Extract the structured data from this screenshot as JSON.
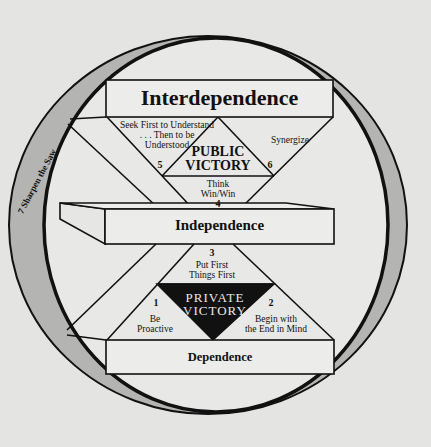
{
  "diagram": {
    "colors": {
      "background": "#e4e4e2",
      "ring": "#b4b4b2",
      "box_fill": "#ececea",
      "stroke": "#111111",
      "private_victory_fill": "#111111",
      "private_victory_text": "#e8e8e8"
    },
    "levels": {
      "interdependence": "Interdependence",
      "independence": "Independence",
      "dependence": "Dependence"
    },
    "victories": {
      "public": [
        "PUBLIC",
        "VICTORY"
      ],
      "private": [
        "PRIVATE",
        "VICTORY"
      ]
    },
    "habits": [
      {
        "number": "1",
        "lines": [
          "Be",
          "Proactive"
        ]
      },
      {
        "number": "2",
        "lines": [
          "Begin with",
          "the End in Mind"
        ]
      },
      {
        "number": "3",
        "lines": [
          "Put First",
          "Things First"
        ]
      },
      {
        "number": "4",
        "lines": [
          "Think",
          "Win/Win"
        ]
      },
      {
        "number": "5",
        "lines": [
          "Seek First to Understand",
          ". . . Then to be",
          "Understood"
        ]
      },
      {
        "number": "6",
        "lines": [
          "Synergize"
        ]
      },
      {
        "number": "7",
        "lines": [
          "Sharpen the Saw"
        ]
      }
    ],
    "ring_label": "7  Sharpen the Saw"
  }
}
